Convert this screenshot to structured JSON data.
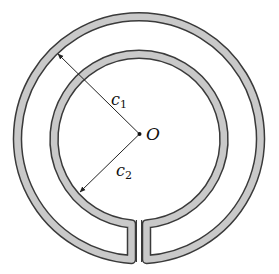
{
  "diagram": {
    "center": {
      "label": "O",
      "x": 139.5,
      "y": 134
    },
    "outer_ring": {
      "centerline_radius": 121.5,
      "band_width": 8
    },
    "inner_ring": {
      "centerline_radius": 85,
      "band_width": 8
    },
    "dimensions": [
      {
        "label_main": "c",
        "label_sub": "1",
        "from": "O",
        "to": "outer ring inner edge (upper-left)"
      },
      {
        "label_main": "c",
        "label_sub": "2",
        "from": "O",
        "to": "inner ring outer edge (lower-left)"
      }
    ],
    "colors": {
      "band_fill": "#c9c9c9",
      "outline": "#3a3a3a",
      "line": "#222222",
      "background": "#ffffff"
    }
  }
}
